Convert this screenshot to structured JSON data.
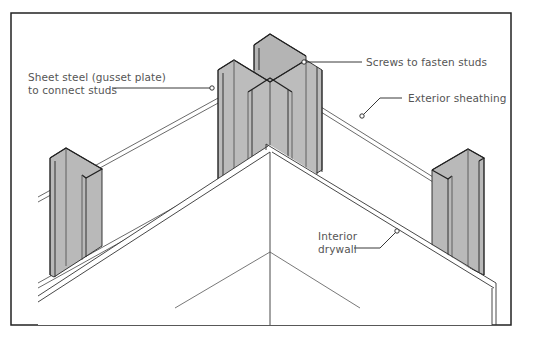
{
  "figure": {
    "labels": {
      "gusset_line1": "Sheet steel (gusset plate)",
      "gusset_line2": "to connect studs",
      "screws": "Screws to fasten studs",
      "sheathing": "Exterior sheathing",
      "drywall_line1": "Interior",
      "drywall_line2": "drywall"
    },
    "colors": {
      "steel": "#b9b9b9",
      "steel_dark": "#a8a8a8",
      "line": "#333333",
      "frame": "#222222",
      "label": "#555555"
    }
  }
}
